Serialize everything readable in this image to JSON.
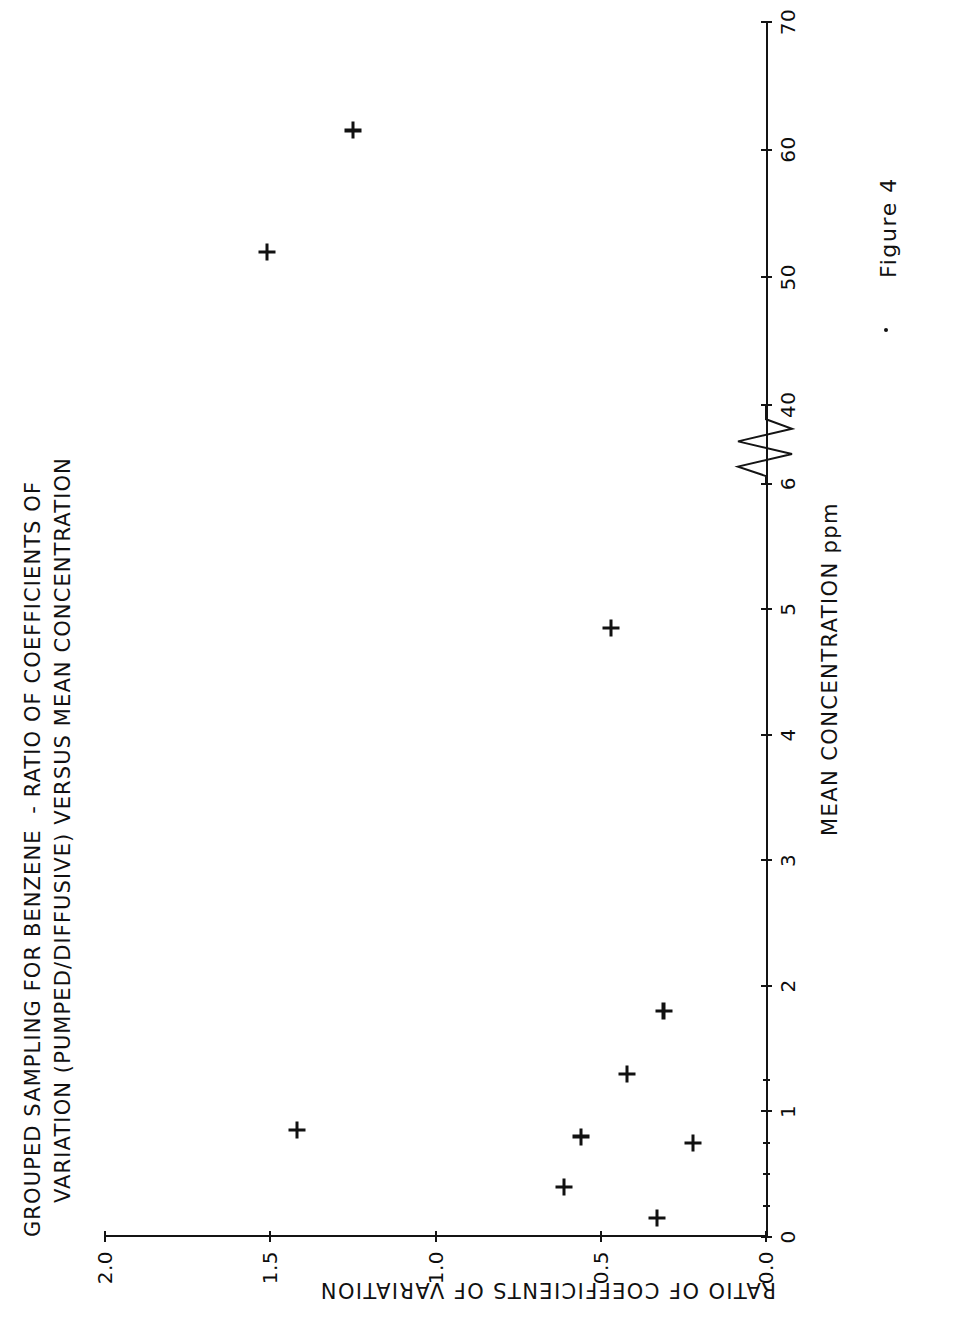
{
  "figure": {
    "caption": "Figure 4",
    "title_line1": "GROUPED SAMPLING FOR BENZENE  - RATIO OF COEFFICIENTS OF",
    "title_line2": "VARIATION (PUMPED/DIFFUSIVE) VERSUS MEAN CONCENTRATION"
  },
  "chart_data": {
    "type": "scatter",
    "xlabel": "MEAN CONCENTRATION ppm",
    "ylabel": "RATIO OF COEFFICIENTS OF VARIATION",
    "marker": "plus",
    "grid": false,
    "legend": null,
    "axis_break": {
      "axis": "x",
      "between": [
        6,
        40
      ],
      "style": "zigzag"
    },
    "xlim": [
      0,
      70
    ],
    "ylim": [
      0.0,
      2.0
    ],
    "xticks": [
      0,
      1,
      2,
      3,
      4,
      5,
      6,
      40,
      50,
      60,
      70
    ],
    "xticklabels": [
      "0",
      "1",
      "2",
      "3",
      "4",
      "5",
      "6",
      "40",
      "50",
      "60",
      "70"
    ],
    "xminorticks": [
      0.25,
      0.5,
      0.75,
      1.25
    ],
    "yticks": [
      0.0,
      0.5,
      1.0,
      1.5,
      2.0
    ],
    "yticklabels": [
      "0.0",
      "0.5",
      "1.0",
      "1.5",
      "2.0"
    ],
    "x": [
      0.15,
      0.4,
      0.75,
      0.8,
      0.85,
      1.3,
      1.8,
      4.85,
      52,
      61.5
    ],
    "y": [
      0.33,
      0.61,
      0.22,
      0.56,
      1.42,
      0.42,
      0.31,
      0.47,
      1.51,
      1.25
    ],
    "points": [
      {
        "x": 0.15,
        "y": 0.33,
        "px": 821,
        "py": 1145
      },
      {
        "x": 0.4,
        "y": 0.61,
        "px": 699,
        "py": 1187
      },
      {
        "x": 0.75,
        "y": 0.22,
        "px": 866,
        "py": 1098
      },
      {
        "x": 0.8,
        "y": 0.56,
        "px": 730,
        "py": 1092
      },
      {
        "x": 0.85,
        "y": 1.42,
        "px": 330,
        "py": 1152
      },
      {
        "x": 1.3,
        "y": 0.42,
        "px": 766,
        "py": 1065
      },
      {
        "x": 1.8,
        "y": 0.31,
        "px": 785,
        "py": 1018
      },
      {
        "x": 4.85,
        "y": 0.47,
        "px": 699,
        "py": 651
      },
      {
        "x": 52,
        "y": 1.51,
        "px": 228,
        "py": 241
      },
      {
        "x": 61.5,
        "y": 1.25,
        "px": 393,
        "py": 126
      }
    ]
  }
}
